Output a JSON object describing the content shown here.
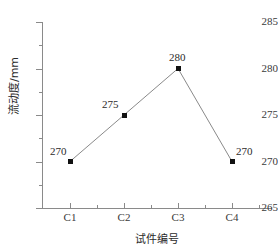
{
  "chart_data": {
    "type": "line",
    "title": "",
    "xlabel": "试件编号",
    "ylabel": "流动度/mm",
    "categories": [
      "C1",
      "C2",
      "C3",
      "C4"
    ],
    "values": [
      270,
      275,
      280,
      270
    ],
    "point_labels": [
      "270",
      "275",
      "280",
      "270"
    ],
    "ylim": [
      265,
      285
    ],
    "yticks": [
      265,
      270,
      275,
      280,
      285
    ],
    "ytick_labels": [
      "265",
      "270",
      "275",
      "280",
      "285"
    ],
    "y_minor_ticks": [
      267.5,
      272.5,
      277.5,
      282.5
    ],
    "grid": false,
    "legend": null,
    "series": [
      {
        "name": "流动度",
        "values": [
          270,
          275,
          280,
          270
        ],
        "marker": "filled-square",
        "marker_color": "#111111",
        "line_color": "#8a8a8a"
      }
    ]
  },
  "colors": {
    "axis": "#8a8a8a",
    "text": "#2b2b2b",
    "tick_text": "#3a3a3a",
    "marker": "#111111",
    "line": "#8a8a8a",
    "background": "#ffffff"
  }
}
